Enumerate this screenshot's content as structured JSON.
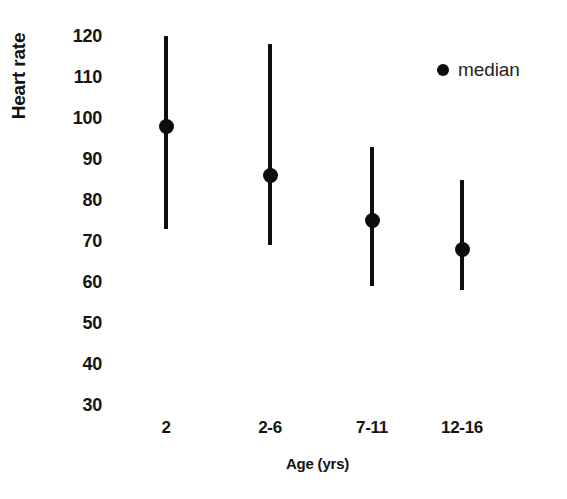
{
  "chart_data": {
    "type": "line",
    "title": "",
    "subtitle": "",
    "xlabel": "Age (yrs)",
    "ylabel": "Heart rate",
    "categories": [
      "2",
      "2-6",
      "7-11",
      "12-16"
    ],
    "ylim": [
      30,
      120
    ],
    "ytick_labels": [
      "120",
      "110",
      "100",
      "90",
      "80",
      "70",
      "60",
      "50",
      "40",
      "30"
    ],
    "yticks": [
      120,
      110,
      100,
      90,
      80,
      70,
      60,
      50,
      40,
      30
    ],
    "grid": false,
    "legend_position": "top-right",
    "legend": [
      {
        "label": "median",
        "marker": "filled-circle",
        "color": "#0d0d0d"
      }
    ],
    "series": [
      {
        "name": "median",
        "values": [
          98,
          86,
          75,
          68
        ]
      },
      {
        "name": "range-low",
        "values": [
          73,
          69,
          59,
          58
        ]
      },
      {
        "name": "range-high",
        "values": [
          120,
          118,
          93,
          85
        ]
      }
    ],
    "points": [
      {
        "category": "2",
        "median": 98,
        "low": 73,
        "high": 120
      },
      {
        "category": "2-6",
        "median": 86,
        "low": 69,
        "high": 118
      },
      {
        "category": "7-11",
        "median": 75,
        "low": 59,
        "high": 93
      },
      {
        "category": "12-16",
        "median": 68,
        "low": 58,
        "high": 85
      }
    ],
    "colors": {
      "marker": "#0d0d0d",
      "line": "#0d0d0d",
      "text": "#151515",
      "background": "#ffffff"
    }
  },
  "axes": {
    "y_title": "Heart rate",
    "x_title": "Age (yrs)"
  },
  "legend": {
    "median_label": "median"
  }
}
